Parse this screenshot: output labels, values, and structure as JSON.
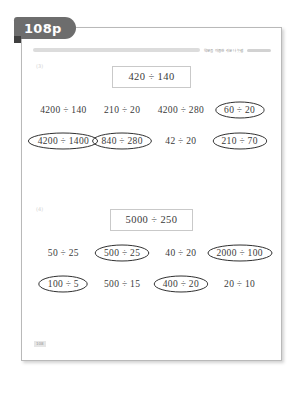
{
  "page_tab": {
    "label": "108p"
  },
  "header": {
    "caption": "약분을 이용한 쉬운 나눗셈",
    "bar_icon": "horizontal-rule",
    "dash_icon": "short-rule"
  },
  "footer": {
    "mark": "108"
  },
  "problems": [
    {
      "marker": "(3)",
      "prompt": "420 ÷ 140",
      "rows": [
        [
          {
            "expr": "4200 ÷ 140",
            "circled": false
          },
          {
            "expr": "210 ÷ 20",
            "circled": false
          },
          {
            "expr": "4200 ÷ 280",
            "circled": false
          },
          {
            "expr": "60 ÷ 20",
            "circled": true
          }
        ],
        [
          {
            "expr": "4200 ÷ 1400",
            "circled": true
          },
          {
            "expr": "840 ÷ 280",
            "circled": true
          },
          {
            "expr": "42 ÷ 20",
            "circled": false
          },
          {
            "expr": "210 ÷ 70",
            "circled": true
          }
        ]
      ]
    },
    {
      "marker": "(4)",
      "prompt": "5000 ÷ 250",
      "rows": [
        [
          {
            "expr": "50 ÷ 25",
            "circled": false
          },
          {
            "expr": "500 ÷ 25",
            "circled": true
          },
          {
            "expr": "40 ÷ 20",
            "circled": false
          },
          {
            "expr": "2000 ÷ 100",
            "circled": true
          }
        ],
        [
          {
            "expr": "100 ÷ 5",
            "circled": true
          },
          {
            "expr": "500 ÷ 15",
            "circled": false
          },
          {
            "expr": "400 ÷ 20",
            "circled": true
          },
          {
            "expr": "20 ÷ 10",
            "circled": false
          }
        ]
      ]
    }
  ]
}
